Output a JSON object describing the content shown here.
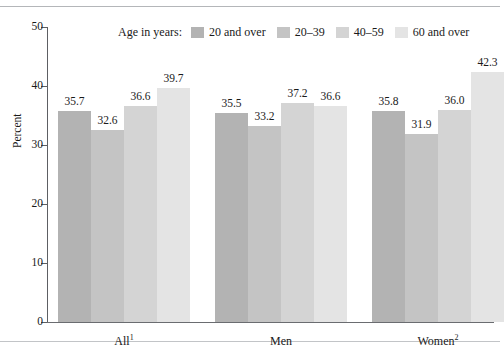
{
  "chart_data": {
    "type": "bar",
    "title": "",
    "subtitle": "",
    "xlabel": "",
    "ylabel": "Percent",
    "ylim": [
      0,
      50
    ],
    "yticks": [
      "0",
      "10",
      "20",
      "30",
      "40",
      "50"
    ],
    "grid": false,
    "legend_position": "top-center",
    "legend_title": "Age in years:",
    "categories": [
      "All",
      "Men",
      "Women"
    ],
    "category_labels": [
      {
        "text": "All",
        "footnote": "1"
      },
      {
        "text": "Men",
        "footnote": ""
      },
      {
        "text": "Women",
        "footnote": "2"
      }
    ],
    "series": [
      {
        "name": "20 and over",
        "color": "#b3b3b3",
        "values": [
          35.7,
          35.5,
          35.8
        ],
        "value_labels": [
          "35.7",
          "35.5",
          "35.8"
        ]
      },
      {
        "name": "20–39",
        "color": "#c4c4c4",
        "values": [
          32.6,
          33.2,
          31.9
        ],
        "value_labels": [
          "32.6",
          "33.2",
          "31.9"
        ]
      },
      {
        "name": "40–59",
        "color": "#d4d4d4",
        "values": [
          36.6,
          37.2,
          36.0
        ],
        "value_labels": [
          "36.6",
          "37.2",
          "36.0"
        ]
      },
      {
        "name": "60 and over",
        "color": "#e4e4e4",
        "values": [
          39.7,
          36.6,
          42.3
        ],
        "value_labels": [
          "39.7",
          "36.6",
          "42.3"
        ]
      }
    ],
    "axis_color": "#5d5f63",
    "frame_rule_color": "#b4b6b9"
  }
}
